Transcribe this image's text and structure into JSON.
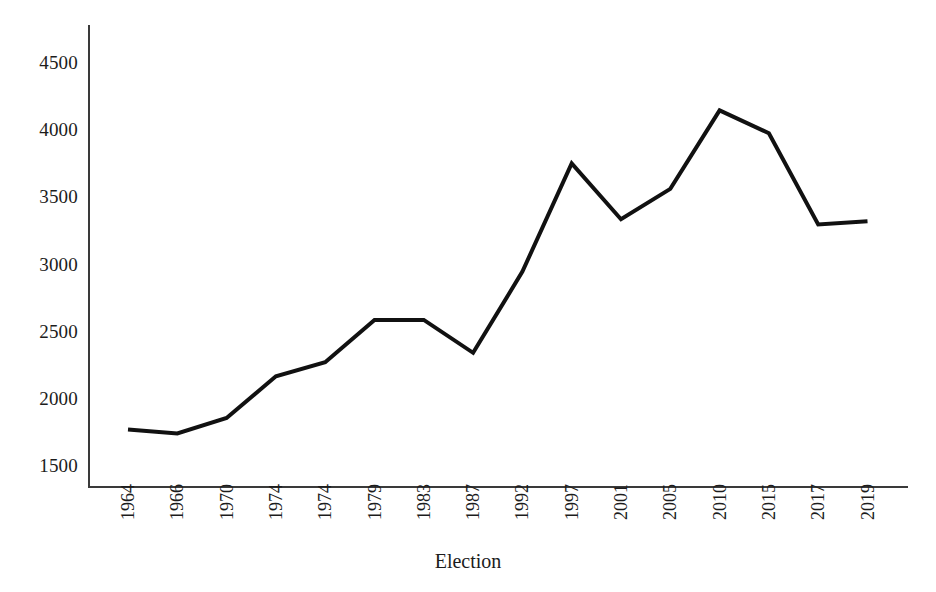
{
  "chart_data": {
    "type": "line",
    "title": "",
    "subtitle": "",
    "xlabel": "Election",
    "ylabel": "",
    "grid": false,
    "legend": null,
    "legend_position": "none",
    "line_color": "#111111",
    "axis_color": "#3a3a3a",
    "categories": [
      "1964",
      "1966",
      "1970",
      "1974",
      "1974",
      "1979",
      "1983",
      "1987",
      "1992",
      "1997",
      "2001",
      "2005",
      "2010",
      "2015",
      "2017",
      "2019"
    ],
    "series": [
      {
        "name": "Election",
        "values": [
          1765,
          1735,
          1850,
          2160,
          2265,
          2580,
          2580,
          2335,
          2940,
          3745,
          3330,
          3555,
          4140,
          3970,
          3290,
          3315
        ]
      }
    ],
    "ylim": [
      1336,
      4672
    ],
    "yticks": [
      1500,
      2000,
      2500,
      3000,
      3500,
      4000,
      4500
    ],
    "ytick_labels": [
      "1500",
      "2000",
      "2500",
      "3000",
      "3500",
      "4000",
      "4500"
    ],
    "xlim_index": [
      0,
      15
    ]
  },
  "axis": {
    "x_title": "Election"
  }
}
